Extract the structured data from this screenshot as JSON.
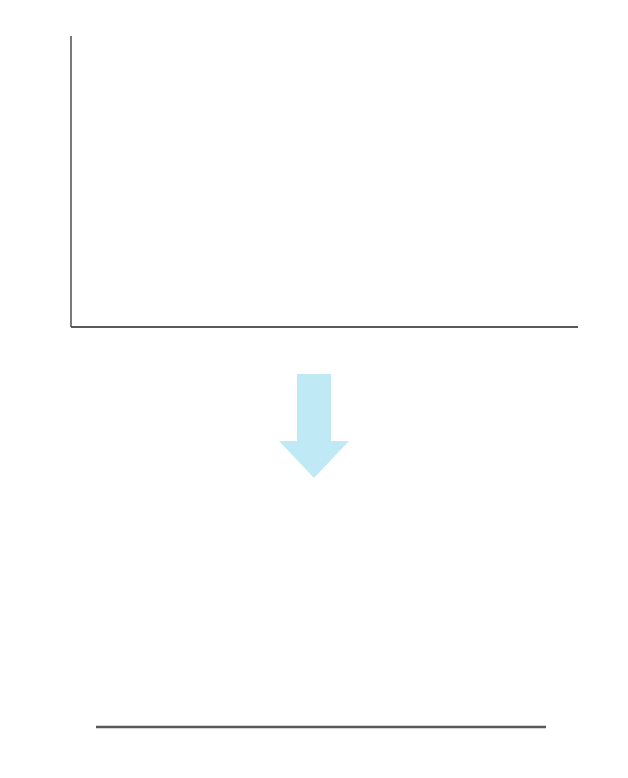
{
  "figure": {
    "background": "#ffffff",
    "marker_color": "#7fccdf",
    "curve_color": "#3ba5bf",
    "arrow_color": "#bfeaf5",
    "axis_color": "#58595b",
    "grid_color": "#939598",
    "text_color": "#231f20"
  },
  "transform_annotation": {
    "text": "（対数変換）",
    "icon": "down-arrow-icon"
  },
  "chart_data": [
    {
      "type": "scatter",
      "title": "",
      "xlabel": "",
      "ylabel": "",
      "xlim": [
        0,
        12
      ],
      "ylim": [
        0,
        0.45
      ],
      "grid": true,
      "grid_axis": "y",
      "legend": "none",
      "marker": "diamond",
      "marker_color": "#7fccdf",
      "xticks": [
        0,
        2,
        4,
        6,
        8,
        10,
        12
      ],
      "xtick_labels": [
        "0",
        "2",
        "4",
        "6",
        "8",
        "10",
        "12"
      ],
      "yticks": [
        0,
        0.05,
        0.1,
        0.15,
        0.2,
        0.25,
        0.3,
        0.35,
        0.4,
        0.45
      ],
      "ytick_labels": [
        "0",
        "0.05",
        "0.1",
        "0.15",
        "0.2",
        "0.25",
        "0.3",
        "0.35",
        "0.4",
        "0.45"
      ],
      "x": [
        0.0,
        0.2,
        0.4,
        0.6,
        0.8,
        1.0,
        1.2,
        1.4,
        1.6,
        1.8,
        2.0,
        2.2,
        2.4,
        2.6,
        2.8,
        3.0,
        3.2,
        3.4,
        3.6,
        3.8,
        4.0,
        4.2,
        4.4,
        4.6,
        4.8,
        5.0,
        5.2,
        5.4,
        5.6,
        5.8,
        6.0,
        6.2,
        6.4,
        6.6,
        6.8,
        7.0,
        7.2,
        7.4,
        7.6,
        7.8,
        8.0,
        8.2,
        8.4,
        8.6,
        8.8,
        9.0,
        9.2,
        9.4,
        9.6,
        9.8,
        10.0
      ],
      "values": [
        0.0,
        0.11,
        0.265,
        0.351,
        0.39,
        0.403,
        0.395,
        0.388,
        0.379,
        0.368,
        0.357,
        0.345,
        0.333,
        0.321,
        0.309,
        0.296,
        0.284,
        0.272,
        0.26,
        0.249,
        0.237,
        0.226,
        0.215,
        0.205,
        0.195,
        0.185,
        0.176,
        0.167,
        0.158,
        0.15,
        0.142,
        0.135,
        0.128,
        0.121,
        0.115,
        0.109,
        0.103,
        0.098,
        0.093,
        0.088,
        0.066,
        0.061,
        0.057,
        0.053,
        0.05,
        0.047,
        0.044,
        0.041,
        0.039,
        0.036,
        0.034
      ]
    },
    {
      "type": "line",
      "title": "",
      "xlabel": "",
      "ylabel": "",
      "xlim": [
        -4,
        4
      ],
      "ylim": [
        0,
        0.42
      ],
      "grid": false,
      "legend": "none",
      "curve": "standard-normal-pdf",
      "curve_color": "#3ba5bf",
      "xticks": [
        -4,
        -3,
        -2,
        -1,
        0,
        1,
        2,
        3,
        4
      ],
      "xtick_labels": [
        "−4",
        "−3",
        "−2",
        "−1",
        "0",
        "1",
        "2",
        "3",
        "4"
      ],
      "reference_lines": [
        -2,
        -1,
        0,
        1,
        2
      ],
      "reference_line_style": "dashed",
      "x_drawn_range": [
        -3.05,
        3.05
      ],
      "x": [
        -3.0,
        -2.8,
        -2.6,
        -2.4,
        -2.2,
        -2.0,
        -1.8,
        -1.6,
        -1.4,
        -1.2,
        -1.0,
        -0.8,
        -0.6,
        -0.4,
        -0.2,
        0.0,
        0.2,
        0.4,
        0.6,
        0.8,
        1.0,
        1.2,
        1.4,
        1.6,
        1.8,
        2.0,
        2.2,
        2.4,
        2.6,
        2.8,
        3.0
      ],
      "values": [
        0.0044,
        0.0079,
        0.0136,
        0.0224,
        0.0355,
        0.054,
        0.079,
        0.1109,
        0.1497,
        0.1942,
        0.242,
        0.2897,
        0.3332,
        0.3683,
        0.391,
        0.3989,
        0.391,
        0.3683,
        0.3332,
        0.2897,
        0.242,
        0.1942,
        0.1497,
        0.1109,
        0.079,
        0.054,
        0.0355,
        0.0224,
        0.0136,
        0.0079,
        0.0044
      ]
    }
  ]
}
